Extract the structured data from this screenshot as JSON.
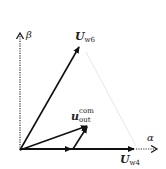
{
  "diagram": {
    "type": "vector-diagram",
    "axes": {
      "alpha_label": "α",
      "beta_label": "β"
    },
    "vectors": [
      {
        "id": "U_w6",
        "main": "U",
        "sub": "w6",
        "from": [
          20,
          150
        ],
        "to": [
          80,
          45
        ]
      },
      {
        "id": "U_w4",
        "main": "U",
        "sub": "w4",
        "from": [
          20,
          150
        ],
        "to": [
          136,
          148
        ]
      },
      {
        "id": "u_out_com",
        "main": "u",
        "sub": "out",
        "sup": "com",
        "from": [
          20,
          150
        ],
        "to": [
          88,
          125
        ]
      },
      {
        "id": "component_alpha",
        "from": [
          20,
          150
        ],
        "to": [
          72,
          149
        ]
      },
      {
        "id": "component_w6",
        "from": [
          72,
          149
        ],
        "to": [
          88,
          125
        ]
      }
    ],
    "colors": {
      "vector": "#1a1a1a",
      "axis": "#333333",
      "guide": "#dddddd"
    }
  }
}
